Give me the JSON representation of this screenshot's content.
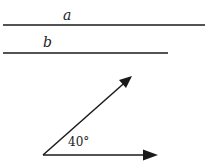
{
  "diagram": {
    "lines": [
      {
        "id": "a",
        "label": "a",
        "x1": 3,
        "y1": 25,
        "x2": 205,
        "y2": 25,
        "label_x": 63,
        "label_y": 20
      },
      {
        "id": "b",
        "label": "b",
        "x1": 3,
        "y1": 53,
        "x2": 168,
        "y2": 53,
        "label_x": 43,
        "label_y": 47
      }
    ],
    "angle": {
      "vertex": {
        "x": 43,
        "y": 155
      },
      "ray1_tip": {
        "x": 132,
        "y": 76
      },
      "ray2_tip": {
        "x": 158,
        "y": 155
      },
      "label": "40°",
      "label_x": 68,
      "label_y": 146
    },
    "colors": {
      "stroke": "#1a1a1a",
      "background": "#ffffff"
    }
  }
}
